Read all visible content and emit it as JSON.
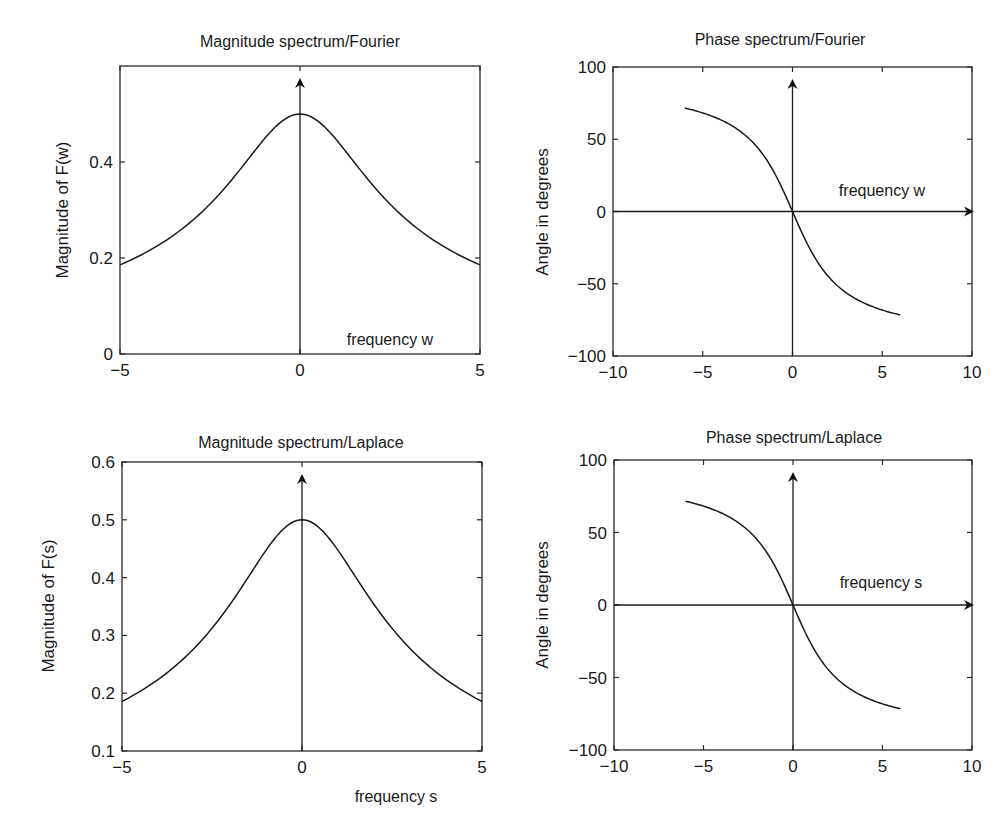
{
  "chart_data": [
    {
      "id": "mag_fourier",
      "type": "line",
      "title": "Magnitude spectrum/Fourier",
      "xlabel": "",
      "ylabel": "Magnitude of F(w)",
      "annotation": "frequency w",
      "xlim": [
        -5,
        5
      ],
      "ylim": [
        0,
        0.6
      ],
      "xticks": [
        -5,
        0,
        5
      ],
      "xtick_labels": [
        "−5",
        "0",
        "5"
      ],
      "yticks": [
        0,
        0.2,
        0.4
      ],
      "ytick_labels": [
        "0",
        "0.2",
        "0.4"
      ],
      "grid": false,
      "vertical_arrow_at": 0,
      "horizontal_arrow_at": null,
      "plot_box": {
        "x0": 120,
        "x1": 480,
        "y_top": 66,
        "y_bottom": 354
      },
      "series": [
        {
          "name": "|F(w)|",
          "x": [
            -5,
            -4,
            -3,
            -2,
            -1.5,
            -1,
            -0.5,
            0,
            0.5,
            1,
            1.5,
            2,
            3,
            4,
            5
          ],
          "y": [
            0.186,
            0.224,
            0.277,
            0.354,
            0.4,
            0.447,
            0.485,
            0.5,
            0.485,
            0.447,
            0.4,
            0.354,
            0.277,
            0.224,
            0.186
          ]
        }
      ]
    },
    {
      "id": "phase_fourier",
      "type": "line",
      "title": "Phase spectrum/Fourier",
      "xlabel": "",
      "ylabel": "Angle in degrees",
      "annotation": "frequency w",
      "xlim": [
        -10,
        10
      ],
      "ylim": [
        -100,
        100
      ],
      "xticks": [
        -10,
        -5,
        0,
        5,
        10
      ],
      "xtick_labels": [
        "−10",
        "−5",
        "0",
        "5",
        "10"
      ],
      "yticks": [
        -100,
        -50,
        0,
        50,
        100
      ],
      "ytick_labels": [
        "−100",
        "−50",
        "0",
        "50",
        "100"
      ],
      "grid": false,
      "vertical_arrow_at": 0,
      "horizontal_arrow_at": 0,
      "plot_box": {
        "x0": 613,
        "x1": 972,
        "y_top": 67,
        "y_bottom": 356
      },
      "series": [
        {
          "name": "angle F(w)",
          "x": [
            -6,
            -5,
            -4,
            -3,
            -2,
            -1,
            -0.5,
            0,
            0.5,
            1,
            2,
            3,
            4,
            5,
            6
          ],
          "y": [
            71.6,
            68.2,
            63.4,
            56.3,
            45,
            26.6,
            14,
            0,
            -14,
            -26.6,
            -45,
            -56.3,
            -63.4,
            -68.2,
            -71.6
          ]
        }
      ]
    },
    {
      "id": "mag_laplace",
      "type": "line",
      "title": "Magnitude spectrum/Laplace",
      "xlabel": "frequency s",
      "ylabel": "Magnitude of F(s)",
      "annotation": "",
      "xlim": [
        -5,
        5
      ],
      "ylim": [
        0.1,
        0.6
      ],
      "xticks": [
        -5,
        0,
        5
      ],
      "xtick_labels": [
        "−5",
        "0",
        "5"
      ],
      "yticks": [
        0.1,
        0.2,
        0.3,
        0.4,
        0.5,
        0.6
      ],
      "ytick_labels": [
        "0.1",
        "0.2",
        "0.3",
        "0.4",
        "0.5",
        "0.6"
      ],
      "grid": false,
      "vertical_arrow_at": 0,
      "horizontal_arrow_at": null,
      "plot_box": {
        "x0": 122,
        "x1": 482,
        "y_top": 462,
        "y_bottom": 751
      },
      "series": [
        {
          "name": "|F(s)|",
          "x": [
            -5,
            -4,
            -3,
            -2,
            -1.5,
            -1,
            -0.5,
            0,
            0.5,
            1,
            1.5,
            2,
            3,
            4,
            5
          ],
          "y": [
            0.186,
            0.224,
            0.277,
            0.354,
            0.4,
            0.447,
            0.485,
            0.5,
            0.485,
            0.447,
            0.4,
            0.354,
            0.277,
            0.224,
            0.186
          ]
        }
      ]
    },
    {
      "id": "phase_laplace",
      "type": "line",
      "title": "Phase spectrum/Laplace",
      "xlabel": "",
      "ylabel": "Angle in degrees",
      "annotation": "frequency s",
      "xlim": [
        -10,
        10
      ],
      "ylim": [
        -100,
        100
      ],
      "xticks": [
        -10,
        -5,
        0,
        5,
        10
      ],
      "xtick_labels": [
        "−10",
        "−5",
        "0",
        "5",
        "10"
      ],
      "yticks": [
        -100,
        -50,
        0,
        50,
        100
      ],
      "ytick_labels": [
        "−100",
        "−50",
        "0",
        "50",
        "100"
      ],
      "grid": false,
      "vertical_arrow_at": 0,
      "horizontal_arrow_at": 0,
      "plot_box": {
        "x0": 614,
        "x1": 972,
        "y_top": 460,
        "y_bottom": 750
      },
      "series": [
        {
          "name": "angle F(s)",
          "x": [
            -6,
            -5,
            -4,
            -3,
            -2,
            -1,
            -0.5,
            0,
            0.5,
            1,
            2,
            3,
            4,
            5,
            6
          ],
          "y": [
            71.6,
            68.2,
            63.4,
            56.3,
            45,
            26.6,
            14,
            0,
            -14,
            -26.6,
            -45,
            -56.3,
            -63.4,
            -68.2,
            -71.6
          ]
        }
      ]
    }
  ]
}
